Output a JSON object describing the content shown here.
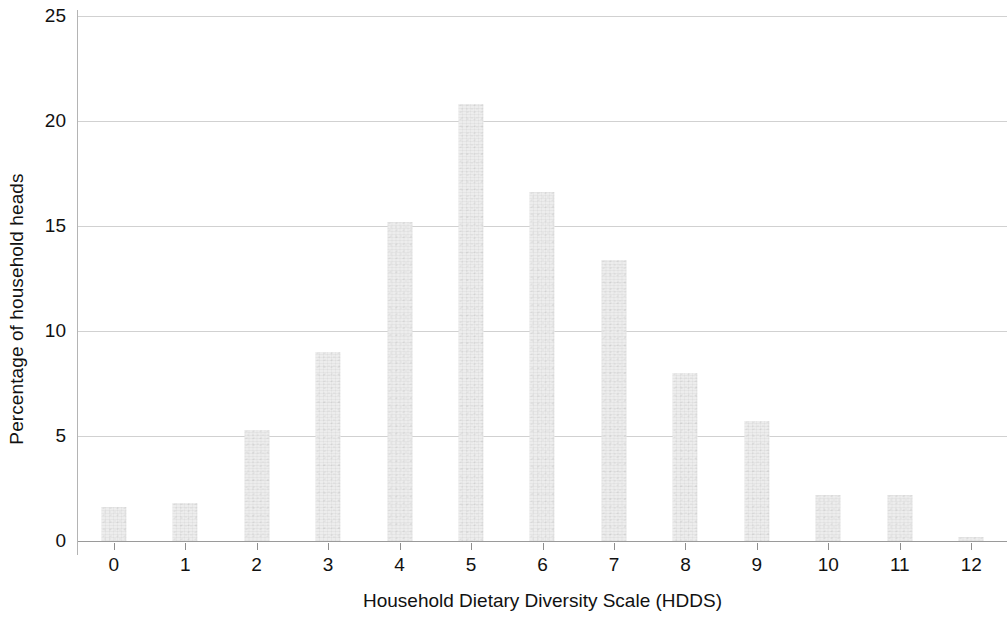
{
  "chart_data": {
    "type": "bar",
    "title": "",
    "subtitle": "",
    "xlabel": "Household Dietary Diversity Scale (HDDS)",
    "ylabel": "Percentage of household heads",
    "categories": [
      "0",
      "1",
      "2",
      "3",
      "4",
      "5",
      "6",
      "7",
      "8",
      "9",
      "10",
      "11",
      "12"
    ],
    "values": [
      1.6,
      1.8,
      5.3,
      9.0,
      15.2,
      20.8,
      16.6,
      13.4,
      8.0,
      5.7,
      2.2,
      2.2,
      0.2
    ],
    "ylim": [
      0,
      25
    ],
    "yticks": [
      0,
      5,
      10,
      15,
      20,
      25
    ],
    "ytick_labels": [
      "0",
      "5",
      "10",
      "15",
      "20",
      "25"
    ],
    "grid": true,
    "grid_axis": "y",
    "legend": null,
    "legend_position": "none",
    "bar_color": "#ededed",
    "gridline_color": "#c9c9c9",
    "axis_color": "#9a9a9a",
    "text_color": "#111111",
    "background_color": "#ffffff",
    "annotations": []
  }
}
